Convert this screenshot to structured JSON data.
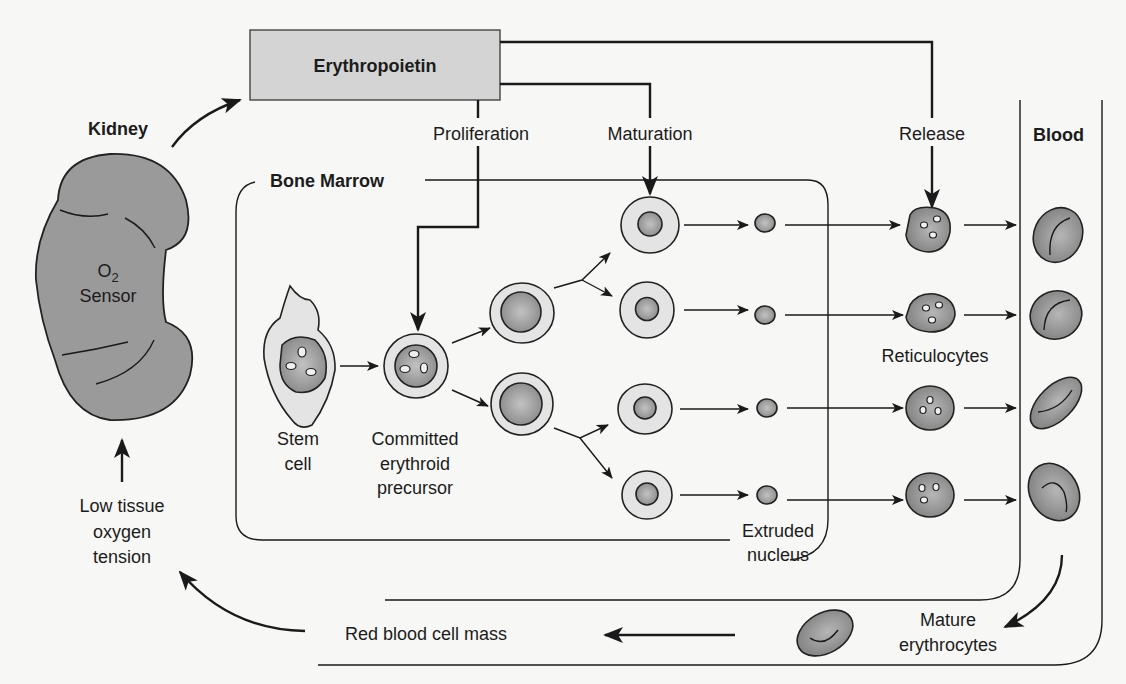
{
  "diagram": {
    "hormone_box": {
      "label": "Erythropoietin",
      "fill": "#d4d4d4"
    },
    "organ": {
      "name": "Kidney",
      "sensor_main": "O",
      "sensor_sub": "2",
      "sensor_label": "Sensor",
      "fill": "#9a9a9a"
    },
    "regions": {
      "bone_marrow": "Bone Marrow",
      "blood": "Blood"
    },
    "actions": {
      "proliferation": "Proliferation",
      "maturation": "Maturation",
      "release": "Release"
    },
    "cells": {
      "stem_line1": "Stem",
      "stem_line2": "cell",
      "precursor_line1": "Committed",
      "precursor_line2": "erythroid",
      "precursor_line3": "precursor",
      "reticulocytes": "Reticulocytes",
      "extruded_line1": "Extruded",
      "extruded_line2": "nucleus",
      "mature_line1": "Mature",
      "mature_line2": "erythrocytes"
    },
    "feedback": {
      "rbc_mass": "Red blood cell mass",
      "low_o2_line1": "Low tissue",
      "low_o2_line2": "oxygen",
      "low_o2_line3": "tension"
    },
    "colors": {
      "cytoplasm": "#e4e4e4",
      "nucleus": "#9a9a9a",
      "rbc": "#8e8e8e",
      "stroke": "#1a1a1a"
    }
  }
}
